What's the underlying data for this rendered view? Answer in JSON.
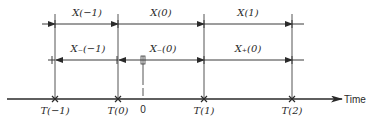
{
  "diagram": {
    "axis_label": "Time",
    "origin_label": "0",
    "time_marks": [
      {
        "label": "T(−1)"
      },
      {
        "label": "T(0)"
      },
      {
        "label": "T(1)"
      },
      {
        "label": "T(2)"
      }
    ],
    "top_row": [
      {
        "label": "X(−1)"
      },
      {
        "label": "X(0)"
      },
      {
        "label": "X(1)"
      }
    ],
    "middle_row": [
      {
        "label": "X₋(−1)"
      },
      {
        "label": "X₋(0)"
      },
      {
        "label": "X₊(0)"
      }
    ],
    "colors": {
      "line": "#3a3a3a",
      "text": "#2a2a2a",
      "background": "#ffffff"
    }
  }
}
